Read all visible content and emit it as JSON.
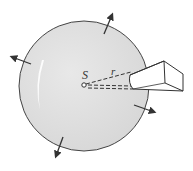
{
  "diagram": {
    "labels": {
      "source": "S",
      "radius": "r"
    },
    "colors": {
      "sphere_fill": "#e2e2e2",
      "outline": "#444444",
      "detector_fill": "#ffffff",
      "background": "#ffffff"
    },
    "sphere": {
      "cx": 84,
      "cy": 86,
      "r": 65
    },
    "arrows": [
      {
        "name": "arrow-up-right",
        "x1": 104,
        "y1": 34,
        "x2": 113,
        "y2": 13
      },
      {
        "name": "arrow-left",
        "x1": 31,
        "y1": 64,
        "x2": 10,
        "y2": 56
      },
      {
        "name": "arrow-right-down",
        "x1": 134,
        "y1": 105,
        "x2": 156,
        "y2": 113
      },
      {
        "name": "arrow-down-left",
        "x1": 63,
        "y1": 137,
        "x2": 55,
        "y2": 158
      }
    ],
    "detector": {
      "description": "Detector box aperture receiving radiation"
    }
  }
}
